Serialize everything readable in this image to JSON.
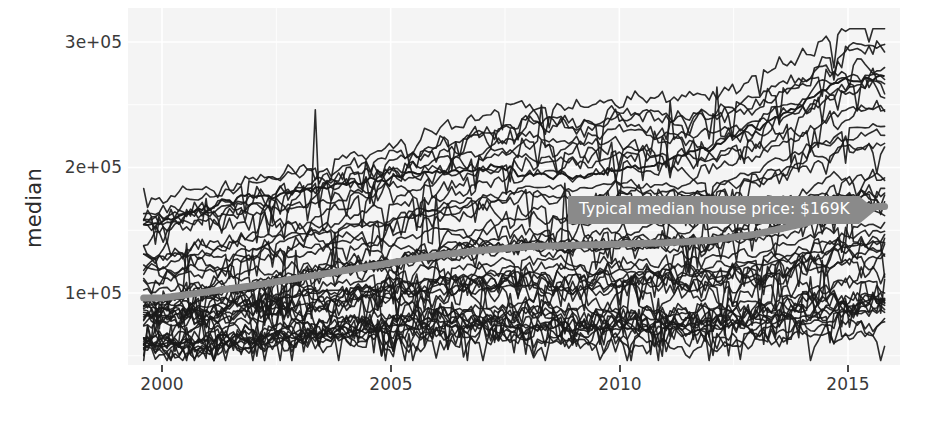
{
  "chart_data": {
    "type": "line",
    "title": "",
    "subtitle": "",
    "xlabel": "",
    "ylabel": "median",
    "xlim": [
      1999.6,
      2015.8
    ],
    "ylim": [
      45000,
      312000
    ],
    "xticks": [
      2000,
      2005,
      2010,
      2015
    ],
    "xticklabels": [
      "2000",
      "2005",
      "2010",
      "2015"
    ],
    "yticks": [
      100000,
      200000,
      300000
    ],
    "yticklabels": [
      "1e+05",
      "2e+05",
      "3e+05"
    ],
    "grid": true,
    "legend": "none",
    "panel_background": "#f4f4f4",
    "line_color": "#1a1a1a",
    "trend_color": "#8a8a8a",
    "annotations": [
      {
        "text": "Typical median house price: $169K",
        "x": 2013.6,
        "y": 176000,
        "background": "#8a8a8a",
        "text_color": "#ffffff",
        "arrow": "right"
      }
    ],
    "series": [
      {
        "name": "trend_loess",
        "role": "smooth-trend",
        "color": "#8a8a8a",
        "x": [
          2000.0,
          2001.0,
          2002.0,
          2003.0,
          2004.0,
          2005.0,
          2006.0,
          2007.0,
          2008.0,
          2009.0,
          2010.0,
          2011.0,
          2012.0,
          2013.0,
          2014.0,
          2015.0,
          2015.6
        ],
        "values": [
          96000,
          101000,
          106000,
          112000,
          118000,
          124000,
          130000,
          134000,
          137000,
          138000,
          139000,
          140000,
          142000,
          147000,
          155000,
          165000,
          169000
        ]
      },
      {
        "name": "top_outlier_series",
        "role": "highest-single-line",
        "color": "#1a1a1a",
        "x": [
          2000,
          2001,
          2002,
          2003,
          2004,
          2005,
          2006,
          2007,
          2008,
          2009,
          2010,
          2011,
          2012,
          2013,
          2014,
          2015
        ],
        "values": [
          156000,
          168000,
          175000,
          182000,
          186000,
          192000,
          197000,
          199000,
          196000,
          193000,
          198000,
          205000,
          215000,
          232000,
          252000,
          272000
        ]
      },
      {
        "name": "upper_envelope",
        "role": "max-of-all-series",
        "color": "#1a1a1a",
        "x": [
          2000,
          2001,
          2002,
          2003,
          2004,
          2005,
          2006,
          2007,
          2008,
          2009,
          2010,
          2011,
          2012,
          2013,
          2014,
          2015
        ],
        "values": [
          168000,
          176000,
          182000,
          190000,
          196000,
          204000,
          214000,
          230000,
          248000,
          236000,
          252000,
          248000,
          244000,
          262000,
          286000,
          302000
        ]
      },
      {
        "name": "lower_envelope",
        "role": "min-of-all-series",
        "color": "#1a1a1a",
        "x": [
          2000,
          2001,
          2002,
          2003,
          2004,
          2005,
          2006,
          2007,
          2008,
          2009,
          2010,
          2011,
          2012,
          2013,
          2014,
          2015
        ],
        "values": [
          58000,
          57000,
          59000,
          61000,
          62000,
          63000,
          64000,
          62000,
          58000,
          54000,
          55000,
          54000,
          55000,
          57000,
          60000,
          63000
        ]
      }
    ],
    "series_count": 46
  },
  "axes": {
    "y_title": "median",
    "y_tick_labels": [
      "3e+05",
      "2e+05",
      "1e+05"
    ],
    "x_tick_labels": [
      "2000",
      "2005",
      "2010",
      "2015"
    ]
  },
  "annotation": {
    "label": "Typical median house price: $169K"
  },
  "colors": {
    "panel": "#f4f4f4",
    "grid": "#ffffff",
    "line": "#1a1a1a",
    "trend": "#8a8a8a",
    "annotation_bg": "#8a8a8a",
    "annotation_text": "#ffffff",
    "tick_text": "#3a3a3a"
  }
}
